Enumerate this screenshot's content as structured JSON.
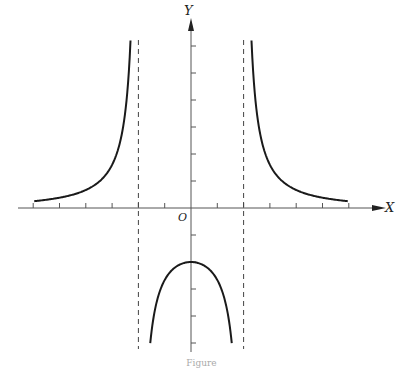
{
  "chart_data": {
    "type": "line",
    "title": "",
    "xlabel": "X",
    "ylabel": "Y",
    "origin_label": "O",
    "function": "y = 8/(x^2 - 4)",
    "xlim": [
      -6.5,
      7.5
    ],
    "ylim": [
      -5.2,
      6.6
    ],
    "x_ticks": [
      -6,
      -5,
      -4,
      -3,
      -2,
      -1,
      1,
      2,
      3,
      4,
      5,
      6
    ],
    "y_ticks": [
      -5,
      -4,
      -3,
      -2,
      -1,
      1,
      2,
      3,
      4,
      5,
      6
    ],
    "tick_labels_shown": false,
    "grid": false,
    "asymptotes": {
      "vertical": [
        -2,
        2
      ],
      "style": "dashed"
    },
    "series": [
      {
        "name": "left branch",
        "x": [
          -6,
          -5,
          -4,
          -3,
          -2.5,
          -2.3
        ],
        "y": [
          0.25,
          0.38,
          0.67,
          1.6,
          3.56,
          6.2
        ]
      },
      {
        "name": "middle branch",
        "x": [
          -1.55,
          -1,
          -0.5,
          0,
          0.5,
          1,
          1.55
        ],
        "y": [
          -5.0,
          -2.67,
          -2.13,
          -2.0,
          -2.13,
          -2.67,
          -5.0
        ]
      },
      {
        "name": "right branch",
        "x": [
          2.3,
          2.5,
          3,
          4,
          5,
          6
        ],
        "y": [
          6.2,
          3.56,
          1.6,
          0.67,
          0.38,
          0.25
        ]
      }
    ],
    "caption": "Figure"
  },
  "labels": {
    "x_axis": "X",
    "y_axis": "Y",
    "origin": "O",
    "caption": "Figure"
  },
  "layout": {
    "origin_px": [
      191,
      208
    ],
    "unit_x_px": 26.3,
    "unit_y_px": 27,
    "colors": {
      "curve": "#1a1a1a",
      "axis": "#555555",
      "asymptote": "#444444"
    }
  }
}
